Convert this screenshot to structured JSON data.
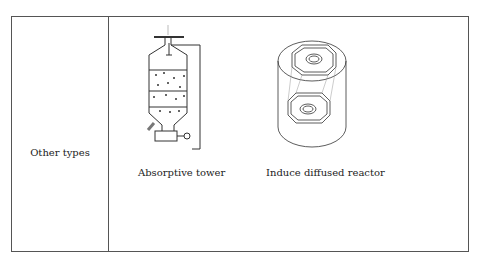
{
  "row": {
    "label": "Other types",
    "figures": [
      {
        "name": "absorptive-tower",
        "caption": "Absorptive tower"
      },
      {
        "name": "induce-diffused-reactor",
        "caption": "Induce diffused reactor"
      }
    ]
  }
}
